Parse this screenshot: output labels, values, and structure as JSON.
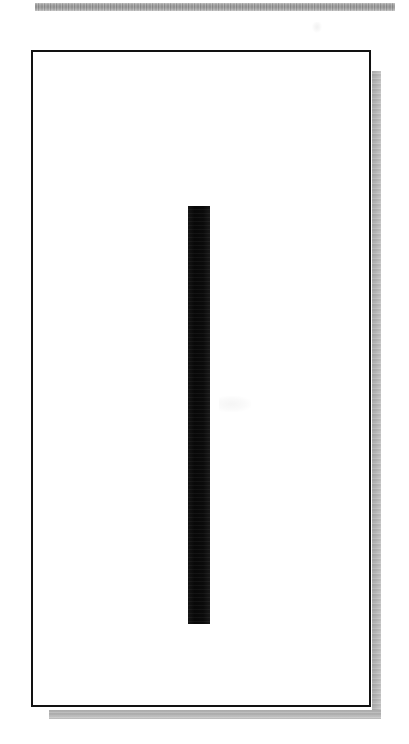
{
  "page": {
    "width_px": 409,
    "height_px": 744,
    "background_color": "#ffffff",
    "kind": "scanned-figure-page"
  },
  "header_rule": {
    "name": "horizontal-rule",
    "color": "#a6a6a6",
    "left_px": 35,
    "top_px": 3,
    "width_px": 360,
    "height_px": 8
  },
  "figure_panel": {
    "name": "bordered-figure-frame",
    "border_color": "#121212",
    "border_width_px": 2,
    "fill_color": "#ffffff",
    "left_px": 31,
    "top_px": 50,
    "width_px": 340,
    "height_px": 657,
    "caption": ""
  },
  "drop_shadow": {
    "name": "panel-drop-shadow",
    "color": "#b9b9b9",
    "offset_x_px": 11,
    "offset_y_px": 12,
    "thickness_px": 9
  },
  "vertical_bar": {
    "name": "vertical-black-bar",
    "color": "#0d0d0d",
    "left_px": 186,
    "top_px": 204,
    "width_px": 22,
    "height_px": 418,
    "label": ""
  },
  "scan_artifacts": [
    {
      "name": "scan-speck-top-right",
      "left_px": 312,
      "top_px": 22,
      "width_px": 10,
      "height_px": 11,
      "opacity": 0.06
    },
    {
      "name": "scan-speck-mid-right",
      "left_px": 217,
      "top_px": 394,
      "width_px": 32,
      "height_px": 16,
      "opacity": 0.04
    }
  ],
  "text": {
    "visible_text": ""
  }
}
